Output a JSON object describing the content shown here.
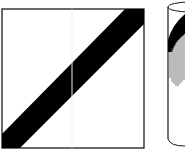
{
  "diagram": {
    "background": "#ffffff",
    "stroke_color": "#1a1a1a",
    "band_color": "#000000",
    "hatch_color": "#555555",
    "figures": [
      {
        "id": "flat-square",
        "description": "Square with a diagonal black band from lower-left to upper-right",
        "shape": "square"
      },
      {
        "id": "cylinder",
        "description": "Cylinder with the diagonal band wrapped around it and a hatched shaded region (partially cropped)",
        "shape": "cylinder"
      }
    ]
  }
}
